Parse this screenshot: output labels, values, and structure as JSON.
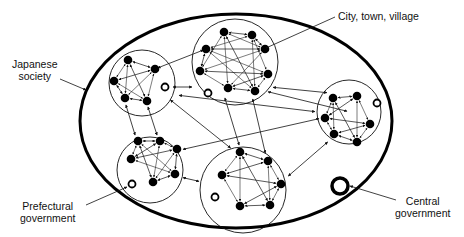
{
  "diagram": {
    "type": "nested-network",
    "colors": {
      "line": "#111111",
      "node": "#000000",
      "background": "#ffffff"
    },
    "outer_boundary": {
      "label_line1": "Japanese",
      "label_line2": "society",
      "shape": "ellipse",
      "cx": 236,
      "cy": 121,
      "rx": 156,
      "ry": 107
    },
    "clusters": [
      {
        "id": "c1",
        "cx": 142,
        "cy": 83,
        "r": 33,
        "nodes": [
          [
            128,
            60
          ],
          [
            155,
            69
          ],
          [
            114,
            81
          ],
          [
            125,
            98
          ],
          [
            147,
            101
          ]
        ],
        "ring": [
          165,
          87
        ]
      },
      {
        "id": "c2",
        "cx": 235,
        "cy": 62,
        "r": 43,
        "nodes": [
          [
            224,
            32
          ],
          [
            252,
            35
          ],
          [
            265,
            49
          ],
          [
            206,
            49
          ],
          [
            200,
            71
          ],
          [
            268,
            74
          ],
          [
            228,
            88
          ],
          [
            255,
            91
          ]
        ],
        "ring": [
          208,
          93
        ]
      },
      {
        "id": "c3",
        "cx": 349,
        "cy": 112,
        "r": 32,
        "nodes": [
          [
            333,
            98
          ],
          [
            357,
            96
          ],
          [
            325,
            118
          ],
          [
            370,
            124
          ],
          [
            334,
            134
          ],
          [
            357,
            142
          ]
        ],
        "ring": [
          377,
          103
        ]
      },
      {
        "id": "c4",
        "cx": 150,
        "cy": 170,
        "r": 33,
        "nodes": [
          [
            138,
            141
          ],
          [
            160,
            141
          ],
          [
            131,
            159
          ],
          [
            177,
            149
          ],
          [
            175,
            174
          ],
          [
            153,
            182
          ]
        ],
        "ring": [
          132,
          184
        ]
      },
      {
        "id": "c5",
        "cx": 243,
        "cy": 190,
        "r": 43,
        "nodes": [
          [
            240,
            152
          ],
          [
            268,
            161
          ],
          [
            222,
            175
          ],
          [
            281,
            184
          ],
          [
            240,
            206
          ],
          [
            270,
            205
          ]
        ],
        "ring": [
          215,
          197
        ]
      }
    ],
    "central_government": {
      "cx": 340,
      "cy": 186,
      "r": 8
    },
    "labels": {
      "city": "City, town, village",
      "prefectural_line1": "Prefectural",
      "prefectural_line2": "government",
      "central_line1": "Central",
      "central_line2": "government"
    }
  }
}
